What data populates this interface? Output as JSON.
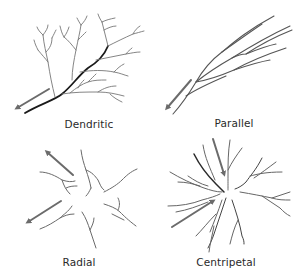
{
  "panels": [
    {
      "id": "dendritic",
      "label": "Dendritic"
    },
    {
      "id": "parallel",
      "label": "Parallel"
    },
    {
      "id": "radial",
      "label": "Radial"
    },
    {
      "id": "centripetal",
      "label": "Centripetal"
    }
  ],
  "colors": {
    "main_stream": "#1a1a1a",
    "tributary": "#7a7a7a",
    "arrow": "#6b6b6b",
    "label": "#2a2a2a",
    "background": "#ffffff"
  },
  "icons": {
    "flow_arrow": "flow-direction-arrow-icon"
  }
}
